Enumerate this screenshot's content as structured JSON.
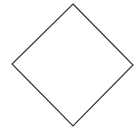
{
  "diagram": {
    "shape": "diamond",
    "stroke_color": "#333333",
    "fill_color": "#ffffff",
    "stroke_width": 1.2,
    "vertices": {
      "top": [
        73,
        4
      ],
      "right": [
        133,
        65
      ],
      "bottom": [
        73,
        126
      ],
      "left": [
        12,
        64
      ]
    },
    "label": ""
  }
}
